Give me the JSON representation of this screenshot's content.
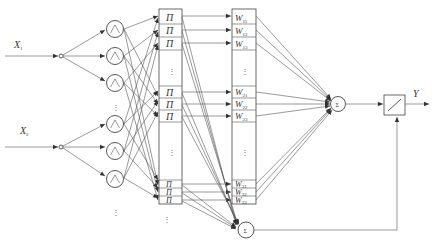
{
  "diagram": {
    "type": "fuzzy-neural-network",
    "inputs": [
      {
        "label": "X",
        "sub": "1"
      },
      {
        "label": "X",
        "sub": "2"
      }
    ],
    "membership_node_symbol": "∧",
    "rule_node_symbol": "Π",
    "rule_nodes_bottom_symbol": "∏",
    "weights": [
      {
        "label": "W",
        "sub": "11"
      },
      {
        "label": "W",
        "sub": "12"
      },
      {
        "label": "W",
        "sub": "13"
      },
      {
        "label": "W",
        "sub": "21"
      },
      {
        "label": "W",
        "sub": "22"
      },
      {
        "label": "W",
        "sub": "23"
      },
      {
        "label": "W",
        "sub": "31"
      },
      {
        "label": "W",
        "sub": "32"
      },
      {
        "label": "W",
        "sub": "33"
      }
    ],
    "sum_node_top": "Σ",
    "sum_node_bottom": "Σ",
    "divider_block": "/",
    "output": {
      "label": "Y"
    },
    "ellipsis": "⋮"
  }
}
